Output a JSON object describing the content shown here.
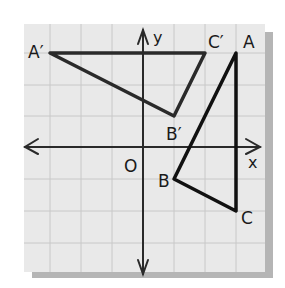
{
  "diagram": {
    "type": "coordinate-grid-reflection",
    "grid": {
      "xmin": -3,
      "xmax": 4,
      "ymin": -4,
      "ymax": 4,
      "unit": 1
    },
    "axes": {
      "x_label": "x",
      "y_label": "y",
      "origin_label": "O"
    },
    "triangles": [
      {
        "name": "ABC",
        "vertices": [
          {
            "label": "A",
            "x": 3,
            "y": 3
          },
          {
            "label": "B",
            "x": 1,
            "y": -1
          },
          {
            "label": "C",
            "x": 3,
            "y": -2
          }
        ]
      },
      {
        "name": "A'B'C'",
        "vertices": [
          {
            "label": "A′",
            "x": -3,
            "y": 3
          },
          {
            "label": "B′",
            "x": 1,
            "y": 1
          },
          {
            "label": "C′",
            "x": 2,
            "y": 3
          }
        ]
      }
    ],
    "colors": {
      "background": "#e9e9e9",
      "grid": "#c8c8c8",
      "lines": "#1a1a1a",
      "shadow": "#b5b5b5"
    }
  }
}
